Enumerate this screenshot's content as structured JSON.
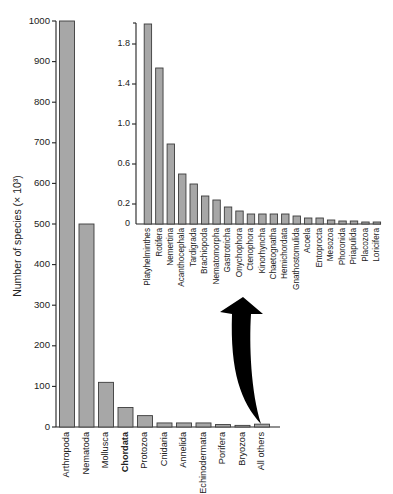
{
  "chart_data": [
    {
      "id": "main",
      "type": "bar",
      "title": "",
      "xlabel": "",
      "ylabel": "Number of species (× 10³)",
      "ylim": [
        0,
        1000
      ],
      "yticks": [
        0,
        100,
        200,
        300,
        400,
        500,
        600,
        700,
        800,
        900,
        1000
      ],
      "grid": false,
      "emphasized_category": "Chordata",
      "categories": [
        "Arthropoda",
        "Nematoda",
        "Mollusca",
        "Chordata",
        "Protozoa",
        "Cnidaria",
        "Annelida",
        "Echinodermata",
        "Porifera",
        "Bryozoa",
        "All others"
      ],
      "values": [
        1000,
        500,
        110,
        48,
        28,
        10,
        10,
        10,
        6,
        4,
        7
      ]
    },
    {
      "id": "inset",
      "type": "bar",
      "title": "",
      "xlabel": "",
      "ylabel": "",
      "ylim": [
        0,
        2.0
      ],
      "yticks": [
        0,
        0.2,
        0.6,
        1.0,
        1.4,
        1.8
      ],
      "ytick_labels": [
        "0",
        "0.2",
        "0.6",
        "1.0",
        "1.4",
        "1.8"
      ],
      "grid": false,
      "annotation": "Curved arrow from 'All others' bar pointing up to inset breakdown",
      "categories": [
        "Platyhelminthes",
        "Rotifera",
        "Nemertina",
        "Acanthocephala",
        "Tardigrada",
        "Brachiopoda",
        "Nematomorpha",
        "Gastrotricha",
        "Onychophora",
        "Ctenophora",
        "Kinorhyncha",
        "Chaetognatha",
        "Hemichordata",
        "Gnathostomulida",
        "Acoela",
        "Entoprocta",
        "Mesozoa",
        "Phoronida",
        "Priapulida",
        "Placozoa",
        "Loricifera"
      ],
      "values": [
        2.0,
        1.56,
        0.8,
        0.5,
        0.4,
        0.28,
        0.24,
        0.17,
        0.13,
        0.1,
        0.1,
        0.1,
        0.1,
        0.08,
        0.06,
        0.06,
        0.04,
        0.03,
        0.03,
        0.02,
        0.02
      ]
    }
  ],
  "colors": {
    "bar_fill": "#a7a7a7",
    "bar_stroke": "#3c3c3c",
    "axis": "#222222",
    "arrow": "#000000"
  }
}
